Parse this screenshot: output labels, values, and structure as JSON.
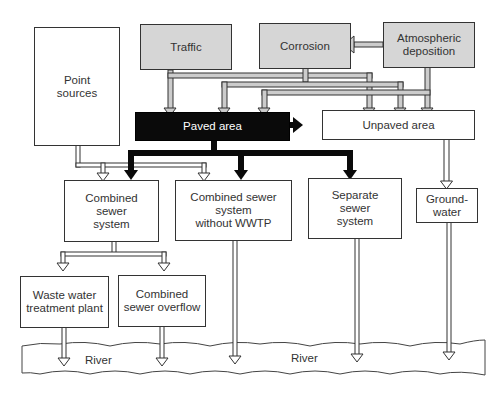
{
  "diagram": {
    "type": "flow",
    "boxes": {
      "point_sources": "Point\nsources",
      "traffic": "Traffic",
      "corrosion": "Corrosion",
      "atmospheric_deposition": "Atmospheric\ndeposition",
      "paved_area": "Paved area",
      "unpaved_area": "Unpaved area",
      "combined_sewer_system": "Combined\nsewer\nsystem",
      "combined_sewer_no_wwtp": "Combined sewer\nsystem\nwithout WWTP",
      "separate_sewer_system": "Separate\nsewer\nsystem",
      "groundwater": "Ground-\nwater",
      "wwtp": "Waste water\ntreatment plant",
      "cso": "Combined\nsewer overflow"
    },
    "river": {
      "label_left": "River",
      "label_right": "River"
    },
    "colors": {
      "source_fill": "#d6d6d6",
      "paved_fill": "#0a0a0a",
      "line": "#333333"
    },
    "edges": [
      [
        "Atmospheric deposition",
        "Corrosion"
      ],
      [
        "Traffic",
        "Paved area"
      ],
      [
        "Traffic",
        "Unpaved area"
      ],
      [
        "Corrosion",
        "Paved area"
      ],
      [
        "Corrosion",
        "Unpaved area"
      ],
      [
        "Atmospheric deposition",
        "Paved area"
      ],
      [
        "Atmospheric deposition",
        "Unpaved area"
      ],
      [
        "Paved area",
        "Unpaved area"
      ],
      [
        "Paved area",
        "Combined sewer system"
      ],
      [
        "Paved area",
        "Combined sewer system without WWTP"
      ],
      [
        "Paved area",
        "Separate sewer system"
      ],
      [
        "Point sources",
        "Combined sewer system"
      ],
      [
        "Point sources",
        "Combined sewer system without WWTP"
      ],
      [
        "Unpaved area",
        "Groundwater"
      ],
      [
        "Combined sewer system",
        "Waste water treatment plant"
      ],
      [
        "Combined sewer system",
        "Combined sewer overflow"
      ],
      [
        "Waste water treatment plant",
        "River"
      ],
      [
        "Combined sewer overflow",
        "River"
      ],
      [
        "Combined sewer system without WWTP",
        "River"
      ],
      [
        "Separate sewer system",
        "River"
      ],
      [
        "Groundwater",
        "River"
      ]
    ]
  }
}
